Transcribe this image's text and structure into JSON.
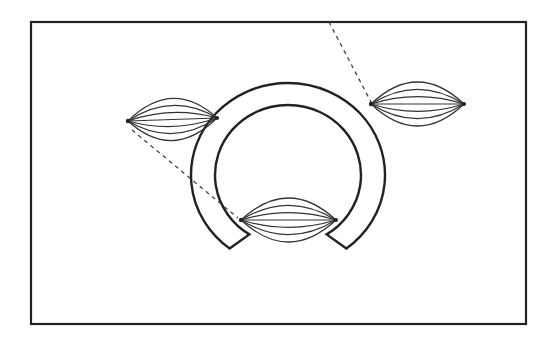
{
  "diagram": {
    "canvas": {
      "width": 557,
      "height": 345,
      "background": "#ffffff"
    },
    "colors": {
      "stroke": "#222222",
      "spindle_stroke": "#333333",
      "dash": "#444444"
    },
    "frame": {
      "x": 31,
      "y": 22,
      "width": 495,
      "height": 302
    },
    "arch": {
      "cx": 288,
      "cy": 175,
      "outer_rx": 97,
      "outer_ry": 92,
      "inner_rx": 73,
      "inner_ry": 70,
      "gap_bottom": true
    },
    "spindles": [
      {
        "id": "left",
        "x1": 128,
        "y1": 121,
        "x2": 217,
        "y2": 118,
        "fibers": 7,
        "height": 42
      },
      {
        "id": "right",
        "x1": 371,
        "y1": 104,
        "x2": 464,
        "y2": 104,
        "fibers": 7,
        "height": 44
      },
      {
        "id": "bottom",
        "x1": 241,
        "y1": 220,
        "x2": 336,
        "y2": 220,
        "fibers": 7,
        "height": 44
      }
    ],
    "dashed_lines": [
      {
        "id": "left-to-bottom",
        "x1": 132,
        "y1": 130,
        "x2": 238,
        "y2": 218
      },
      {
        "id": "top-to-right",
        "x1": 329,
        "y1": 22,
        "x2": 371,
        "y2": 102
      }
    ]
  }
}
